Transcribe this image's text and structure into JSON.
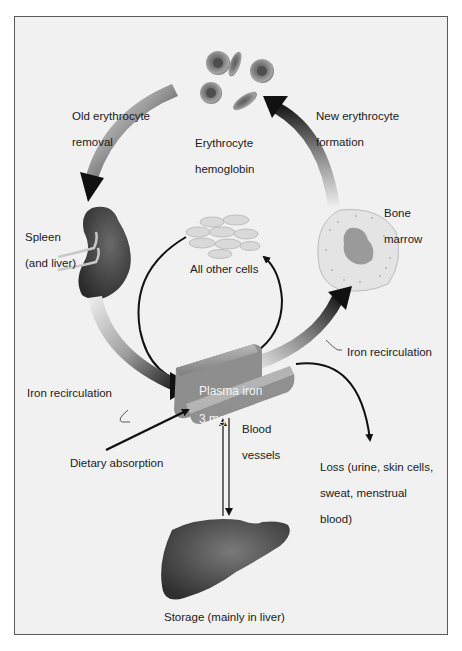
{
  "diagram": {
    "colors": {
      "background": "#f1f1f1",
      "frame_border": "#5a5a5a",
      "organ_dark": "#4a4a4a",
      "rbc": "#8a8a8a",
      "arrow": "#111111"
    },
    "nodes": {
      "erythrocyte": {
        "label_line1": "Erythrocyte",
        "label_line2": "hemoglobin"
      },
      "spleen": {
        "label_line1": "Spleen",
        "label_line2": "(and liver)"
      },
      "bone_marrow": {
        "label_line1": "Bone",
        "label_line2": "marrow"
      },
      "other_cells": {
        "label": "All other cells"
      },
      "plasma": {
        "label_line1": "Plasma iron",
        "label_line2": "3 mg"
      },
      "blood_vessels": {
        "label_line1": "Blood",
        "label_line2": "vessels"
      },
      "storage": {
        "label": "Storage (mainly in liver)"
      }
    },
    "flows": {
      "old_removal": {
        "label_line1": "Old erythrocyte",
        "label_line2": "removal"
      },
      "new_formation": {
        "label_line1": "New erythrocyte",
        "label_line2": "formation"
      },
      "iron_recirc_left": {
        "label": "Iron recirculation"
      },
      "iron_recirc_right": {
        "label": "Iron recirculation"
      },
      "dietary": {
        "label": "Dietary absorption"
      },
      "loss": {
        "label_line1": "Loss (urine, skin cells,",
        "label_line2": "sweat, menstrual",
        "label_line3": "blood)"
      }
    }
  }
}
